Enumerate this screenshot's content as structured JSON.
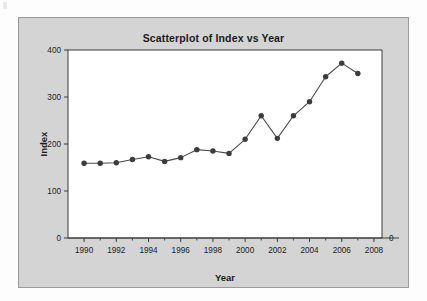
{
  "chart_data": {
    "type": "line",
    "title": "Scatterplot of Index vs Year",
    "xlabel": "Year",
    "ylabel": "Index",
    "x": [
      1990,
      1991,
      1992,
      1993,
      1994,
      1995,
      1996,
      1997,
      1998,
      1999,
      2000,
      2001,
      2002,
      2003,
      2004,
      2005,
      2006,
      2007
    ],
    "values": [
      159,
      159,
      160,
      167,
      173,
      163,
      171,
      188,
      185,
      180,
      210,
      260,
      212,
      260,
      290,
      343,
      372,
      350
    ],
    "series": [
      {
        "name": "Index",
        "values": [
          159,
          159,
          160,
          167,
          173,
          163,
          171,
          188,
          185,
          180,
          210,
          260,
          212,
          260,
          290,
          343,
          372,
          350
        ]
      }
    ],
    "xlim": [
      1989,
      2008.5
    ],
    "ylim": [
      0,
      400
    ],
    "x_ticks": [
      1990,
      1992,
      1994,
      1996,
      1998,
      2000,
      2002,
      2004,
      2006,
      2008
    ],
    "x_tick_labels": [
      "1990",
      "1992",
      "1994",
      "1996",
      "1998",
      "2000",
      "2002",
      "2004",
      "2006",
      "2008"
    ],
    "x_minor_ticks": [
      1991,
      1993,
      1995,
      1997,
      1999,
      2001,
      2003,
      2005,
      2007
    ],
    "y_ticks": [
      0,
      100,
      200,
      300,
      400
    ],
    "y_tick_labels": [
      "0",
      "100",
      "200",
      "300",
      "400"
    ],
    "right_axis_label": "0",
    "grid": false,
    "legend": "none",
    "marker": "filled-circle",
    "marker_color": "#3c3c3c",
    "line_color": "#4a4a4a",
    "plot_background": "#ffffff",
    "panel_background": "#d4d4d4"
  }
}
